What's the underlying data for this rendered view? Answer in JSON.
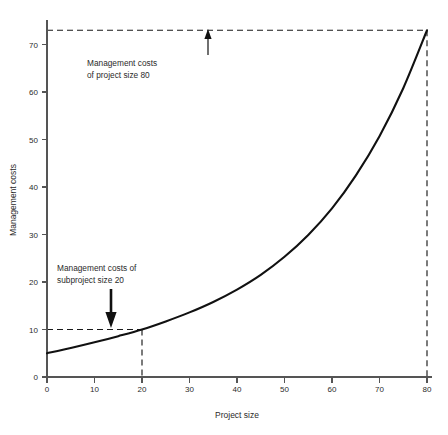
{
  "chart_data": {
    "type": "line",
    "title": "",
    "xlabel": "Project size",
    "ylabel": "Management costs",
    "xlim": [
      0,
      80
    ],
    "ylim": [
      0,
      75
    ],
    "grid": false,
    "legend": "none",
    "x_ticks": [
      0,
      10,
      20,
      30,
      40,
      50,
      60,
      70,
      80
    ],
    "x_tick_labels": [
      "0",
      "10",
      "20",
      "30",
      "40",
      "50",
      "60",
      "70",
      "80"
    ],
    "y_ticks": [
      0,
      10,
      20,
      30,
      40,
      50,
      60,
      70
    ],
    "y_tick_labels": [
      "0",
      "10",
      "20",
      "30",
      "40",
      "50",
      "60",
      "70"
    ],
    "series": [
      {
        "name": "Management costs curve",
        "x": [
          0,
          5,
          10,
          15,
          20,
          25,
          30,
          35,
          40,
          45,
          50,
          55,
          60,
          65,
          70,
          75,
          80
        ],
        "values": [
          5.0,
          6.1,
          7.3,
          8.6,
          10.0,
          11.7,
          13.6,
          15.8,
          18.4,
          21.5,
          25.3,
          29.9,
          35.5,
          42.4,
          50.7,
          60.8,
          73.0
        ]
      }
    ],
    "annotations": [
      {
        "id": "project-80",
        "lines": [
          "Management costs",
          "of project size 80"
        ],
        "points_to": {
          "x": 34,
          "y": 73
        },
        "guides": [
          {
            "type": "horizontal",
            "y": 73,
            "from_x": 0,
            "to_x": 80
          },
          {
            "type": "vertical",
            "x": 80,
            "from_y": 0,
            "to_y": 73
          }
        ]
      },
      {
        "id": "subproject-20",
        "lines": [
          "Management costs of",
          "subproject size 20"
        ],
        "points_to": {
          "x": 13.5,
          "y": 10
        },
        "guides": [
          {
            "type": "horizontal",
            "y": 10,
            "from_x": 0,
            "to_x": 20
          },
          {
            "type": "vertical",
            "x": 20,
            "from_y": 0,
            "to_y": 10
          }
        ]
      }
    ],
    "marked_points": [
      {
        "x": 20,
        "y": 10
      },
      {
        "x": 80,
        "y": 73
      }
    ],
    "colors": {
      "curve": "#111111",
      "axis": "#555555",
      "guide": "#1a1a1a",
      "text": "#2b2b2b",
      "background": "#ffffff"
    }
  }
}
